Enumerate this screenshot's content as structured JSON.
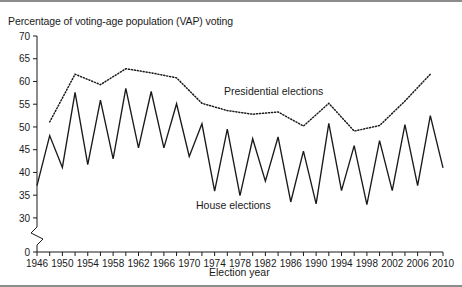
{
  "figure": {
    "title": "Percentage of voting-age population (VAP) voting",
    "x_axis_title": "Election year",
    "background_color": "#ffffff",
    "line_color": "#1a1a1a",
    "rule_color": "#8c8c8c"
  },
  "annotations": {
    "presidential_label": "Presidential elections",
    "house_label": "House elections"
  },
  "chart_data": {
    "type": "line",
    "title": "Percentage of voting-age population (VAP) voting",
    "xlabel": "Election year",
    "ylabel": "",
    "xlim": [
      1946,
      2010
    ],
    "ylim": [
      28,
      70
    ],
    "y_axis_break": true,
    "y_break_from": 0,
    "y_break_to": 28,
    "grid": false,
    "legend": "inline-annotations",
    "yticks": [
      70,
      65,
      60,
      55,
      50,
      45,
      40,
      35,
      30,
      0
    ],
    "ytick_labels": [
      "70",
      "65",
      "60",
      "55",
      "50",
      "45",
      "40",
      "35",
      "30",
      "0"
    ],
    "xticks": [
      1946,
      1948,
      1950,
      1952,
      1954,
      1956,
      1958,
      1960,
      1962,
      1964,
      1966,
      1968,
      1970,
      1972,
      1974,
      1976,
      1978,
      1980,
      1982,
      1984,
      1986,
      1988,
      1990,
      1992,
      1994,
      1996,
      1998,
      2000,
      2002,
      2004,
      2006,
      2008,
      2010
    ],
    "xtick_labels": [
      "1946",
      "",
      "1950",
      "",
      "1954",
      "",
      "1958",
      "",
      "1962",
      "",
      "1966",
      "",
      "1970",
      "",
      "1974",
      "",
      "1978",
      "",
      "1982",
      "",
      "1986",
      "",
      "1990",
      "",
      "1994",
      "",
      "1998",
      "",
      "2002",
      "",
      "2006",
      "",
      "2010"
    ],
    "xtick_labels_shown": [
      "1946",
      "1950",
      "1954",
      "1958",
      "1962",
      "1966",
      "1970",
      "1974",
      "1978",
      "1982",
      "1986",
      "1990",
      "1994",
      "1998",
      "2002",
      "2006",
      "2010"
    ],
    "series": [
      {
        "name": "House elections",
        "style": "solid",
        "x": [
          1946,
          1948,
          1950,
          1952,
          1954,
          1956,
          1958,
          1960,
          1962,
          1964,
          1966,
          1968,
          1970,
          1972,
          1974,
          1976,
          1978,
          1980,
          1982,
          1984,
          1986,
          1988,
          1990,
          1992,
          1994,
          1996,
          1998,
          2000,
          2002,
          2004,
          2006,
          2008,
          2010
        ],
        "values": [
          37.1,
          48.1,
          41.1,
          57.6,
          41.7,
          55.9,
          43.0,
          58.5,
          45.4,
          57.8,
          45.4,
          55.1,
          43.5,
          50.7,
          35.9,
          49.5,
          34.9,
          47.4,
          38.1,
          47.8,
          33.5,
          44.7,
          33.1,
          50.8,
          36.0,
          45.9,
          32.9,
          47.0,
          36.0,
          50.5,
          37.1,
          52.5,
          41.0
        ]
      },
      {
        "name": "Presidential elections",
        "style": "dotted",
        "x": [
          1948,
          1952,
          1956,
          1960,
          1964,
          1968,
          1972,
          1976,
          1980,
          1984,
          1988,
          1992,
          1996,
          2000,
          2004,
          2008
        ],
        "values": [
          51.1,
          61.6,
          59.3,
          62.8,
          61.9,
          60.8,
          55.2,
          53.6,
          52.8,
          53.3,
          50.2,
          55.2,
          49.1,
          50.3,
          55.7,
          61.6
        ]
      }
    ]
  }
}
